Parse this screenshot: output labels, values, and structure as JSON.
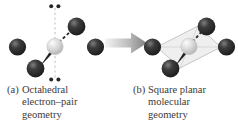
{
  "figure": {
    "name": "vsepr-octahedral-to-square-planar",
    "background_color": "#ffffff"
  },
  "colors": {
    "terminal_atom": "#2b2b2b",
    "terminal_atom_highlight": "#6f6f6f",
    "central_atom": "#d8d8d8",
    "central_atom_highlight": "#f4f4f4",
    "bond": "#8a8a8a",
    "axis_dashed": "#c9c9c9",
    "lone_pair_dot": "#262626",
    "plane_fill": "#e8e8e8",
    "plane_edge": "#c4c4c4",
    "arrow_light": "#f0f0f0",
    "arrow_dark": "#8c8c8c",
    "text": "#3d3a38"
  },
  "panel_a": {
    "name": "octahedral-electron-pair-geometry",
    "central_atom_label": "central-atom",
    "terminal_atom_count": 4,
    "lone_pair_count": 2,
    "lone_pair_positions": [
      "axial-top",
      "axial-bottom"
    ],
    "dots_per_lone_pair": 2,
    "axis_style": "vertical-dashed"
  },
  "panel_b": {
    "name": "square-planar-molecular-geometry",
    "central_atom_label": "central-atom",
    "terminal_atom_count": 4,
    "lone_pair_count": 0,
    "plane_shape": "parallelogram"
  },
  "arrow": {
    "name": "transition-arrow",
    "direction": "right",
    "style": "gradient-block-arrow"
  },
  "caption_a": {
    "tag": "(a)",
    "lines": [
      "Octahedral",
      "electron–pair",
      "geometry"
    ]
  },
  "caption_b": {
    "tag": "(b)",
    "lines": [
      "Square planar",
      "molecular",
      "geometry"
    ]
  }
}
